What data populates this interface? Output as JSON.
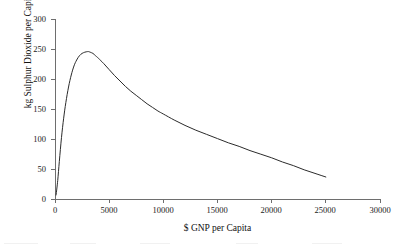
{
  "chart_data": {
    "type": "line",
    "title": "",
    "subtitle": "",
    "xlabel": "$ GNP per Capita",
    "ylabel": "kg Sulphur Dioxide per Capita",
    "xlim": [
      0,
      30000
    ],
    "ylim": [
      0,
      300
    ],
    "xticks": [
      0,
      5000,
      10000,
      15000,
      20000,
      25000,
      30000
    ],
    "xtick_labels": [
      "0",
      "5000",
      "10000",
      "15000",
      "20000",
      "25000",
      "30000"
    ],
    "yticks": [
      0,
      50,
      100,
      150,
      200,
      250,
      300
    ],
    "ytick_labels": [
      "0",
      "50",
      "100",
      "150",
      "200",
      "250",
      "300"
    ],
    "grid": false,
    "legend": null,
    "legend_position": "none",
    "annotations": [],
    "series": [
      {
        "name": "Sulphur dioxide emissions per capita",
        "color": "#2b2b2b",
        "x": [
          100,
          250,
          400,
          600,
          800,
          1000,
          1250,
          1500,
          1750,
          2000,
          2250,
          2500,
          2750,
          3000,
          3100,
          3250,
          3500,
          3750,
          4000,
          4500,
          5000,
          5500,
          6000,
          6500,
          7000,
          7500,
          8000,
          8500,
          9000,
          9500,
          10000,
          11000,
          12000,
          13000,
          14000,
          15000,
          16000,
          17000,
          18000,
          19000,
          20000,
          21000,
          22000,
          23000,
          24000,
          25000
        ],
        "y": [
          6,
          30,
          62,
          102,
          134,
          160,
          186,
          206,
          221,
          231,
          238,
          242,
          244,
          245,
          245,
          244,
          242,
          238,
          234,
          225,
          215,
          205,
          196,
          187,
          179,
          172,
          165,
          158,
          152,
          146,
          141,
          131,
          122,
          114,
          107,
          100,
          93,
          87,
          80,
          74,
          68,
          61,
          55,
          48,
          42,
          36
        ]
      }
    ]
  },
  "axes": {
    "x_title": "$ GNP per Capita",
    "y_title": "kg Sulphur Dioxide per Capita"
  }
}
